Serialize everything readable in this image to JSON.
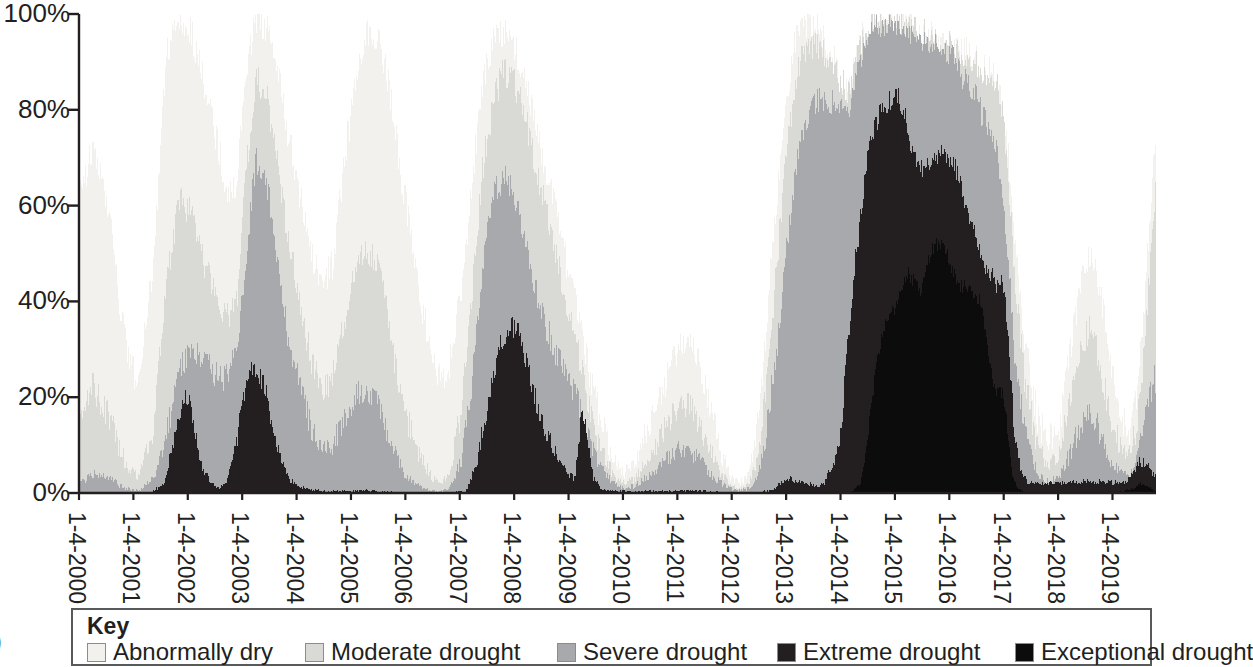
{
  "chart_data": {
    "type": "area",
    "title": "",
    "subtitle": "",
    "xlabel": "",
    "ylabel": "",
    "stacked": true,
    "grid": false,
    "legend_position": "bottom",
    "ylim": [
      0,
      100
    ],
    "ytick_labels": [
      "100%",
      "80%",
      "60%",
      "40%",
      "20%",
      "0%"
    ],
    "ytick_values": [
      100,
      80,
      60,
      40,
      20,
      0
    ],
    "xtick_labels": [
      "1-4-2000",
      "1-4-2001",
      "1-4-2002",
      "1-4-2003",
      "1-4-2004",
      "1-4-2005",
      "1-4-2006",
      "1-4-2007",
      "1-4-2008",
      "1-4-2009",
      "1-4-2010",
      "1-4-2011",
      "1-4-2012",
      "1-4-2013",
      "1-4-2014",
      "1-4-2015",
      "1-4-2016",
      "1-4-2017",
      "1-4-2018",
      "1-4-2019"
    ],
    "x_start_year": 2000,
    "x_end_year": 2019.8,
    "series": [
      {
        "name": "Abnormally dry",
        "color": "#f2f1ee",
        "values": [
          62,
          70,
          66,
          58,
          52,
          48,
          44,
          40,
          36,
          30,
          26,
          24,
          22,
          30,
          52,
          74,
          88,
          95,
          98,
          99,
          99,
          98,
          96,
          93,
          88,
          84,
          80,
          76,
          72,
          68,
          64,
          62,
          60,
          58,
          57,
          56,
          58,
          66,
          78,
          88,
          95,
          98,
          99,
          99,
          98,
          96,
          93,
          90,
          86,
          82,
          78,
          74,
          70,
          66,
          62,
          58,
          54,
          50,
          46,
          44,
          44,
          46,
          52,
          60,
          70,
          80,
          88,
          93,
          96,
          97,
          96,
          94,
          90,
          86,
          82,
          76,
          70,
          64,
          58,
          52,
          46,
          40,
          34,
          30,
          26,
          24,
          24,
          26,
          30,
          36,
          44,
          54,
          64,
          74,
          82,
          88,
          92,
          95,
          96,
          96,
          95,
          93,
          90,
          86,
          82,
          78,
          74,
          70,
          66,
          62,
          58,
          54,
          50,
          46,
          42,
          38,
          34,
          30,
          26,
          22,
          18,
          14,
          10,
          8,
          6,
          5,
          4,
          4,
          5,
          6,
          8,
          10,
          12,
          14,
          16,
          18,
          20,
          22,
          24,
          26,
          28,
          30,
          32,
          34,
          32,
          30,
          28,
          24,
          20,
          16,
          12,
          8,
          6,
          4,
          3,
          2,
          2,
          2,
          3,
          4,
          6,
          10,
          16,
          26,
          40,
          56,
          72,
          84,
          92,
          96,
          98,
          99,
          99,
          98,
          96,
          94,
          91,
          88,
          85,
          83,
          82,
          84,
          88,
          93,
          97,
          99,
          100,
          100,
          99,
          98,
          96,
          94,
          92,
          90,
          88,
          86,
          84,
          82,
          80,
          78,
          76,
          74,
          72,
          70,
          68,
          66,
          64,
          62,
          60,
          56,
          52,
          48,
          44,
          40,
          36,
          32,
          28,
          24,
          20,
          16,
          14,
          12,
          10,
          10,
          12,
          16,
          22,
          30,
          38,
          44,
          48,
          50,
          50,
          48,
          44,
          40,
          36,
          32,
          28,
          24,
          20,
          18,
          16,
          14,
          13,
          13,
          14,
          16,
          20,
          26,
          34,
          44,
          56,
          68,
          78,
          84,
          86,
          84,
          78,
          70,
          60,
          50,
          40,
          32,
          26,
          22,
          20,
          20,
          22,
          26,
          32,
          38,
          44,
          48,
          50,
          50,
          48,
          44,
          38,
          32,
          26,
          22,
          20,
          20,
          22,
          26,
          32,
          38,
          44,
          50,
          56,
          62,
          68,
          74,
          80,
          84,
          86,
          86,
          84,
          80,
          74,
          68,
          62,
          56,
          50,
          46,
          44,
          44,
          46,
          50,
          56,
          62,
          68,
          74,
          78,
          80,
          80,
          78,
          74,
          70,
          66,
          62,
          58,
          54,
          50,
          46,
          42,
          38,
          34,
          30,
          26,
          22,
          18,
          14,
          12,
          10,
          10,
          12,
          16,
          22,
          30,
          40,
          52,
          64,
          74,
          82,
          88,
          92,
          95,
          97,
          98,
          99,
          99,
          99,
          98,
          97,
          96,
          95,
          94,
          93,
          92,
          91,
          90,
          89,
          88,
          87,
          86,
          85,
          84,
          83,
          82,
          81,
          80,
          79,
          78,
          77,
          76,
          75,
          74,
          73,
          72,
          71,
          70,
          69
        ]
      },
      {
        "name": "Moderate drought",
        "color": "#d9d9d6",
        "note": "Second band, light gray"
      },
      {
        "name": "Severe drought",
        "color": "#a7a9ac",
        "note": "Third band, medium gray"
      },
      {
        "name": "Extreme drought",
        "color": "#231f20",
        "note": "Fourth band, near black"
      },
      {
        "name": "Exceptional drought",
        "color": "#0d0c0d",
        "note": "Top band, darkest"
      }
    ],
    "annotations": [
      {
        "period": "2002",
        "peak_extreme_pct": 20,
        "peak_severe_pct": 34
      },
      {
        "period": "2002-2003",
        "peak_extreme_pct": 27,
        "peak_severe_pct": 72
      },
      {
        "period": "2007-2008",
        "peak_extreme_pct": 35,
        "peak_severe_pct": 66
      },
      {
        "period": "2009",
        "peak_extreme_pct": 20
      },
      {
        "period": "2014-2016",
        "peak_exceptional_pct": 58,
        "peak_extreme_pct": 83,
        "peak_total_pct": 100
      },
      {
        "period": "2019",
        "peak_moderate_pct": 82
      }
    ]
  },
  "axis": {
    "y_labels": [
      "100%",
      "80%",
      "60%",
      "40%",
      "20%",
      "0%"
    ],
    "x_labels": [
      "1-4-2000",
      "1-4-2001",
      "1-4-2002",
      "1-4-2003",
      "1-4-2004",
      "1-4-2005",
      "1-4-2006",
      "1-4-2007",
      "1-4-2008",
      "1-4-2009",
      "1-4-2010",
      "1-4-2011",
      "1-4-2012",
      "1-4-2013",
      "1-4-2014",
      "1-4-2015",
      "1-4-2016",
      "1-4-2017",
      "1-4-2018",
      "1-4-2019"
    ]
  },
  "legend": {
    "title": "Key",
    "items": [
      {
        "label": "Abnormally dry",
        "color": "#f2f1ee"
      },
      {
        "label": "Moderate drought",
        "color": "#d9d9d6"
      },
      {
        "label": "Severe drought",
        "color": "#a7a9ac"
      },
      {
        "label": "Extreme drought",
        "color": "#231f20"
      },
      {
        "label": "Exceptional drought",
        "color": "#0d0c0d"
      }
    ]
  },
  "corner": {
    "glyph": ")"
  },
  "colors": {
    "axis": "#231f20",
    "text": "#231f20",
    "legend_border": "#58595b",
    "swatch_border": "#8b8c8e",
    "background": "#ffffff"
  }
}
